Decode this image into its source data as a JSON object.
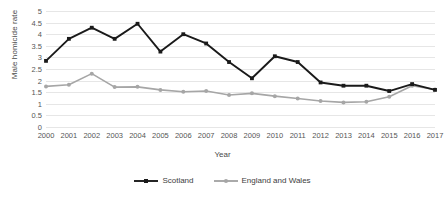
{
  "chart_data": {
    "type": "line",
    "title": "",
    "xlabel": "Year",
    "ylabel": "Male homicide rate",
    "grid": true,
    "legend_position": "bottom",
    "ylim": [
      0,
      5
    ],
    "ytick_labels": [
      "0",
      "0.5",
      "1",
      "1.5",
      "2",
      "2.5",
      "3",
      "3.5",
      "4",
      "4.5",
      "5"
    ],
    "yticks": [
      0,
      0.5,
      1,
      1.5,
      2,
      2.5,
      3,
      3.5,
      4,
      4.5,
      5
    ],
    "categories": [
      "2000",
      "2001",
      "2002",
      "2003",
      "2004",
      "2005",
      "2006",
      "2007",
      "2008",
      "2009",
      "2010",
      "2011",
      "2012",
      "2013",
      "2014",
      "2015",
      "2016",
      "2017"
    ],
    "series": [
      {
        "name": "Scotland",
        "color": "#1a1a1a",
        "marker": "square",
        "values": [
          2.85,
          3.8,
          4.28,
          3.8,
          4.45,
          3.25,
          4.0,
          3.6,
          2.8,
          2.1,
          3.05,
          2.8,
          1.92,
          1.78,
          1.78,
          1.55,
          1.85,
          1.6
        ]
      },
      {
        "name": "England and Wales",
        "color": "#a6a6a6",
        "marker": "circle",
        "values": [
          1.75,
          1.82,
          2.3,
          1.72,
          1.73,
          1.6,
          1.52,
          1.55,
          1.38,
          1.45,
          1.33,
          1.23,
          1.12,
          1.06,
          1.09,
          1.3,
          1.78,
          1.62
        ]
      }
    ]
  }
}
